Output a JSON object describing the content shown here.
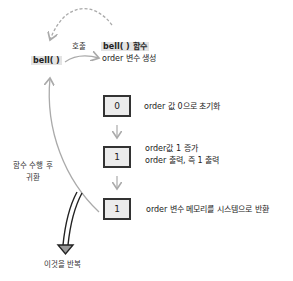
{
  "caller": {
    "label": "bell( )"
  },
  "call_arrow": {
    "label": "호출"
  },
  "function": {
    "title": "bell( ) 함수",
    "subtitle": "order 변수 생성"
  },
  "steps": [
    {
      "value": "0",
      "desc": [
        "order 값 0으로 초기화"
      ]
    },
    {
      "value": "1",
      "desc": [
        "order값 1 증가",
        "order 출력, 즉 1 출력"
      ]
    },
    {
      "value": "1",
      "desc": [
        "order 변수 메모리를 시스템으로 반환"
      ]
    }
  ],
  "return_arrow": {
    "label_line1": "함수 수행 후",
    "label_line2": "귀환"
  },
  "repeat_arrow": {
    "label": "이것을 반복"
  },
  "colors": {
    "box_fill": "#ececec",
    "box_border": "#333333",
    "arrow": "#aaaaaa",
    "highlight": "#e3e3e3"
  }
}
